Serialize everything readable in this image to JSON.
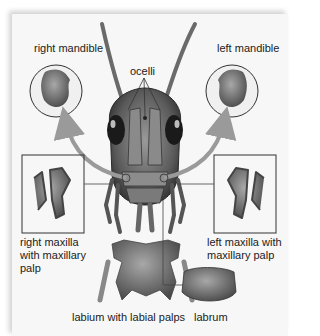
{
  "diagram": {
    "labels": {
      "right_mandible": "right mandible",
      "ocelli": "ocelli",
      "left_mandible": "left mandible",
      "right_maxilla_line1": "right maxilla",
      "right_maxilla_line2": "with maxillary",
      "right_maxilla_line3": "palp",
      "left_maxilla_line1": "left maxilla with",
      "left_maxilla_line2": "maxillary palp",
      "labium": "labium with labial palps",
      "labrum": "labrum"
    },
    "colors": {
      "background": "#f7f7f7",
      "arrow": "#9a9a9a",
      "outline": "#333333",
      "part_dark": "#3a3a3a",
      "part_mid": "#7a7a7a",
      "part_light": "#b8b8b8"
    }
  }
}
